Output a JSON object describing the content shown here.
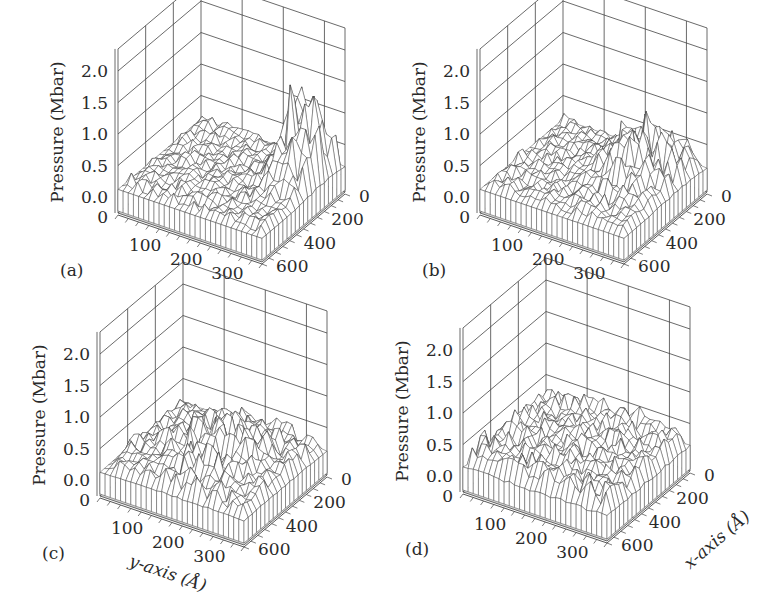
{
  "figure": {
    "background": "#ffffff",
    "floor_color": "#d6d6d6",
    "line_color": "#444444",
    "mesh_color": "#3a3a3a"
  },
  "chart_data": [
    {
      "type": "surface3d",
      "panel": "(a)",
      "zlabel": "Pressure (Mbar)",
      "xlabel": "",
      "ylabel": "",
      "z_ticks": [
        "2.0",
        "1.5",
        "1.0",
        "0.5",
        "0.0"
      ],
      "z_floor_label": "0",
      "y_ticks": [
        "100",
        "200",
        "300"
      ],
      "x_ticks": [
        "0",
        "200",
        "400",
        "600"
      ],
      "zlim": [
        0.0,
        2.0
      ],
      "ylim": [
        0,
        350
      ],
      "xlim": [
        0,
        600
      ],
      "description": "Low background pressure (~0.1-0.3 Mbar) with a tall cluster of sharp peaks near y≈300 Å, x≈0-300 Å reaching ~2.0 Mbar",
      "peak_region": {
        "y_center": 300,
        "x_center": 150,
        "max_pressure": 2.0
      },
      "background_level": 0.2
    },
    {
      "type": "surface3d",
      "panel": "(b)",
      "zlabel": "Pressure (Mbar)",
      "xlabel": "",
      "ylabel": "",
      "z_ticks": [
        "2.0",
        "1.5",
        "1.0",
        "0.5",
        "0.0"
      ],
      "z_floor_label": "0",
      "y_ticks": [
        "100",
        "200",
        "300"
      ],
      "x_ticks": [
        "0",
        "200",
        "400",
        "600"
      ],
      "zlim": [
        0.0,
        2.0
      ],
      "ylim": [
        0,
        350
      ],
      "xlim": [
        0,
        600
      ],
      "description": "Broader field of peaks spread over y≈180-350 Å reaching ~1.1 Mbar",
      "peak_region": {
        "y_center": 260,
        "x_center": 200,
        "max_pressure": 1.1
      },
      "background_level": 0.2
    },
    {
      "type": "surface3d",
      "panel": "(c)",
      "zlabel": "Pressure (Mbar)",
      "xlabel": "",
      "ylabel": "y-axis (Å)",
      "z_ticks": [
        "2.0",
        "1.5",
        "1.0",
        "0.5",
        "0.0"
      ],
      "z_floor_label": "0",
      "y_ticks": [
        "100",
        "200",
        "300"
      ],
      "x_ticks": [
        "0",
        "200",
        "400",
        "600"
      ],
      "zlim": [
        0.0,
        2.0
      ],
      "ylim": [
        0,
        350
      ],
      "xlim": [
        0,
        600
      ],
      "description": "Peaks spread across most of the domain, maximum ~0.8 Mbar",
      "peak_region": {
        "y_center": 200,
        "x_center": 300,
        "max_pressure": 0.8
      },
      "background_level": 0.2
    },
    {
      "type": "surface3d",
      "panel": "(d)",
      "zlabel": "Pressure (Mbar)",
      "xlabel": "x-axis (Å)",
      "ylabel": "",
      "z_ticks": [
        "2.0",
        "1.5",
        "1.0",
        "0.5",
        "0.0"
      ],
      "z_floor_label": "0",
      "y_ticks": [
        "100",
        "200",
        "300"
      ],
      "x_ticks": [
        "0",
        "200",
        "400",
        "600"
      ],
      "zlim": [
        0.0,
        2.0
      ],
      "ylim": [
        0,
        350
      ],
      "xlim": [
        0,
        600
      ],
      "description": "Nearly uniform rough surface, maximum ~0.5 Mbar",
      "peak_region": {
        "y_center": 175,
        "x_center": 300,
        "max_pressure": 0.5
      },
      "background_level": 0.25
    }
  ],
  "panels": [
    {
      "id": "a",
      "label": "(a)",
      "ox": 0,
      "oy": 0,
      "amp": 1.85,
      "spread": "narrow",
      "seed": 11
    },
    {
      "id": "b",
      "label": "(b)",
      "ox": 362,
      "oy": 0,
      "amp": 0.95,
      "spread": "medium",
      "seed": 23
    },
    {
      "id": "c",
      "label": "(c)",
      "ox": -18,
      "oy": 283,
      "amp": 0.65,
      "spread": "wide",
      "seed": 37
    },
    {
      "id": "d",
      "label": "(d)",
      "ox": 345,
      "oy": 279,
      "amp": 0.32,
      "spread": "uniform",
      "seed": 51
    }
  ],
  "axis_titles": {
    "z": "Pressure (Mbar)",
    "y": "y-axis (Å)",
    "x": "x-axis (Å)"
  }
}
